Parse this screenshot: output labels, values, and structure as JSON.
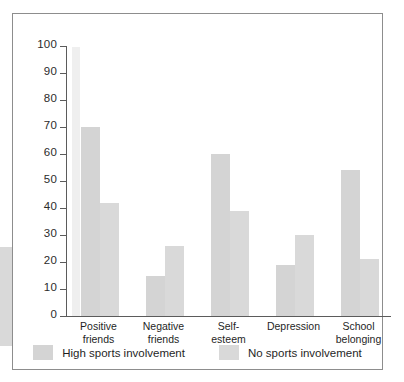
{
  "chart_data": {
    "type": "bar",
    "title": "",
    "subtitle": "",
    "xlabel": "",
    "ylabel": "",
    "ylim": [
      0,
      100
    ],
    "ytick_step": 10,
    "yticks": [
      100,
      90,
      80,
      70,
      60,
      50,
      40,
      30,
      20,
      10,
      0
    ],
    "grid": false,
    "legend_position": "bottom",
    "categories": [
      "Positive friends",
      "Negative friends",
      "Self-esteem",
      "Depression",
      "School belonging"
    ],
    "category_lines": [
      [
        "Positive",
        "friends"
      ],
      [
        "Negative",
        "friends"
      ],
      [
        "Self-",
        "esteem"
      ],
      [
        "Depression",
        ""
      ],
      [
        "School",
        "belonging"
      ]
    ],
    "series": [
      {
        "name": "High sports involvement",
        "color": "#d4d4d4",
        "values": [
          70,
          15,
          60,
          19,
          54
        ]
      },
      {
        "name": "No sports involvement",
        "color": "#d9d9d9",
        "values": [
          42,
          26,
          39,
          30,
          21
        ]
      }
    ]
  },
  "legend": {
    "items": [
      {
        "label": "High sports involvement"
      },
      {
        "label": "No sports involvement"
      }
    ]
  },
  "figure": {
    "frame_color": "#8d8d8d",
    "axis_color": "#5b5b5b",
    "background": "#ffffff"
  }
}
